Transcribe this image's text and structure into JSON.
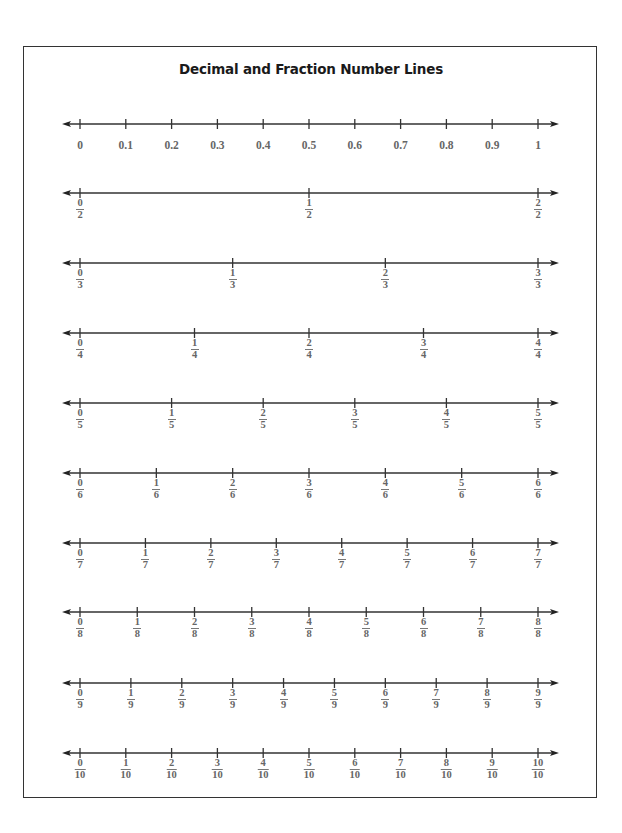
{
  "title": "Decimal and Fraction Number Lines",
  "colors": {
    "line": "#333333",
    "label": "#666666",
    "title": "#1a1a1a"
  },
  "layout": {
    "tick_start_x": 80,
    "tick_end_x": 538,
    "arrow_left_x": 62,
    "arrow_right_x": 559,
    "row_y": [
      124,
      193,
      263,
      333,
      403,
      473,
      543,
      612,
      683,
      753
    ]
  },
  "number_lines": [
    {
      "type": "decimal",
      "labels": [
        "0",
        "0.1",
        "0.2",
        "0.3",
        "0.4",
        "0.5",
        "0.6",
        "0.7",
        "0.8",
        "0.9",
        "1"
      ]
    },
    {
      "type": "fraction",
      "denominator": 2,
      "labels": [
        {
          "n": "0",
          "d": "2"
        },
        {
          "n": "1",
          "d": "2"
        },
        {
          "n": "2",
          "d": "2"
        }
      ]
    },
    {
      "type": "fraction",
      "denominator": 3,
      "labels": [
        {
          "n": "0",
          "d": "3"
        },
        {
          "n": "1",
          "d": "3"
        },
        {
          "n": "2",
          "d": "3"
        },
        {
          "n": "3",
          "d": "3"
        }
      ]
    },
    {
      "type": "fraction",
      "denominator": 4,
      "labels": [
        {
          "n": "0",
          "d": "4"
        },
        {
          "n": "1",
          "d": "4"
        },
        {
          "n": "2",
          "d": "4"
        },
        {
          "n": "3",
          "d": "4"
        },
        {
          "n": "4",
          "d": "4"
        }
      ]
    },
    {
      "type": "fraction",
      "denominator": 5,
      "labels": [
        {
          "n": "0",
          "d": "5"
        },
        {
          "n": "1",
          "d": "5"
        },
        {
          "n": "2",
          "d": "5"
        },
        {
          "n": "3",
          "d": "5"
        },
        {
          "n": "4",
          "d": "5"
        },
        {
          "n": "5",
          "d": "5"
        }
      ]
    },
    {
      "type": "fraction",
      "denominator": 6,
      "labels": [
        {
          "n": "0",
          "d": "6"
        },
        {
          "n": "1",
          "d": "6"
        },
        {
          "n": "2",
          "d": "6"
        },
        {
          "n": "3",
          "d": "6"
        },
        {
          "n": "4",
          "d": "6"
        },
        {
          "n": "5",
          "d": "6"
        },
        {
          "n": "6",
          "d": "6"
        }
      ]
    },
    {
      "type": "fraction",
      "denominator": 7,
      "labels": [
        {
          "n": "0",
          "d": "7"
        },
        {
          "n": "1",
          "d": "7"
        },
        {
          "n": "2",
          "d": "7"
        },
        {
          "n": "3",
          "d": "7"
        },
        {
          "n": "4",
          "d": "7"
        },
        {
          "n": "5",
          "d": "7"
        },
        {
          "n": "6",
          "d": "7"
        },
        {
          "n": "7",
          "d": "7"
        }
      ]
    },
    {
      "type": "fraction",
      "denominator": 8,
      "labels": [
        {
          "n": "0",
          "d": "8"
        },
        {
          "n": "1",
          "d": "8"
        },
        {
          "n": "2",
          "d": "8"
        },
        {
          "n": "3",
          "d": "8"
        },
        {
          "n": "4",
          "d": "8"
        },
        {
          "n": "5",
          "d": "8"
        },
        {
          "n": "6",
          "d": "8"
        },
        {
          "n": "7",
          "d": "8"
        },
        {
          "n": "8",
          "d": "8"
        }
      ]
    },
    {
      "type": "fraction",
      "denominator": 9,
      "labels": [
        {
          "n": "0",
          "d": "9"
        },
        {
          "n": "1",
          "d": "9"
        },
        {
          "n": "2",
          "d": "9"
        },
        {
          "n": "3",
          "d": "9"
        },
        {
          "n": "4",
          "d": "9"
        },
        {
          "n": "5",
          "d": "9"
        },
        {
          "n": "6",
          "d": "9"
        },
        {
          "n": "7",
          "d": "9"
        },
        {
          "n": "8",
          "d": "9"
        },
        {
          "n": "9",
          "d": "9"
        }
      ]
    },
    {
      "type": "fraction",
      "denominator": 10,
      "labels": [
        {
          "n": "0",
          "d": "10"
        },
        {
          "n": "1",
          "d": "10"
        },
        {
          "n": "2",
          "d": "10"
        },
        {
          "n": "3",
          "d": "10"
        },
        {
          "n": "4",
          "d": "10"
        },
        {
          "n": "5",
          "d": "10"
        },
        {
          "n": "6",
          "d": "10"
        },
        {
          "n": "7",
          "d": "10"
        },
        {
          "n": "8",
          "d": "10"
        },
        {
          "n": "9",
          "d": "10"
        },
        {
          "n": "10",
          "d": "10"
        }
      ]
    }
  ]
}
